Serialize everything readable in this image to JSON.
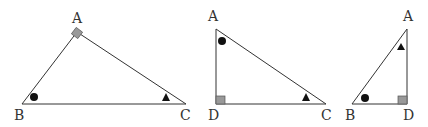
{
  "diagram": {
    "triangles": [
      {
        "id": "ABC",
        "vertices": {
          "A": "A",
          "B": "B",
          "C": "C"
        },
        "right_angle_at": "A",
        "marks": {
          "B": "circle",
          "C": "triangle"
        }
      },
      {
        "id": "ADC",
        "vertices": {
          "A": "A",
          "D": "D",
          "C": "C"
        },
        "right_angle_at": "D",
        "marks": {
          "A": "circle",
          "C": "triangle"
        }
      },
      {
        "id": "ADB",
        "vertices": {
          "A": "A",
          "B": "B",
          "D": "D"
        },
        "right_angle_at": "D",
        "marks": {
          "A": "triangle",
          "B": "circle"
        }
      }
    ],
    "colors": {
      "stroke": "#333333",
      "right_angle_fill": "#999999",
      "mark_fill": "#111111"
    }
  }
}
